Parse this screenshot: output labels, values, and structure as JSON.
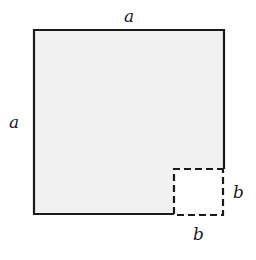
{
  "figure": {
    "colors": {
      "fill": "#f1f1f1",
      "stroke": "#1a1a1a",
      "background": "#ffffff"
    },
    "big_square": {
      "side_label": "a",
      "x": 34,
      "y": 30,
      "right": 224,
      "bottom": 214
    },
    "small_square": {
      "side_label": "b",
      "x": 174,
      "y": 169,
      "right": 223,
      "bottom": 216,
      "stroke_style": "dashed"
    },
    "labels": {
      "top": "a",
      "left": "a",
      "right": "b",
      "bottom": "b"
    }
  }
}
